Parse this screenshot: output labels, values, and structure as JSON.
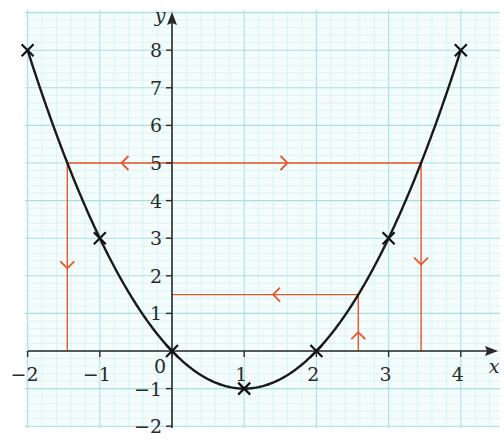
{
  "chart_data": {
    "type": "line",
    "title": "",
    "function": "y = x^2 - 2x",
    "xlabel": "x",
    "ylabel": "y",
    "xlim": [
      -2,
      4.4
    ],
    "ylim": [
      -2,
      8.6
    ],
    "x_ticks": [
      -2,
      -1,
      0,
      1,
      2,
      3,
      4
    ],
    "y_ticks": [
      -2,
      -1,
      1,
      2,
      3,
      4,
      5,
      6,
      7,
      8
    ],
    "x_tick_labels": [
      "−2",
      "−1",
      "0",
      "1",
      "2",
      "3",
      "4"
    ],
    "y_tick_labels": [
      "−2",
      "−1",
      "1",
      "2",
      "3",
      "4",
      "5",
      "6",
      "7",
      "8"
    ],
    "grid": true,
    "grid_minor_step": 0.2,
    "series": [
      {
        "name": "y = x² − 2x",
        "color": "#1a1a1a",
        "plotted_points": [
          {
            "x": -2,
            "y": 8
          },
          {
            "x": -1,
            "y": 3
          },
          {
            "x": 0,
            "y": 0
          },
          {
            "x": 1,
            "y": -1
          },
          {
            "x": 2,
            "y": 0
          },
          {
            "x": 3,
            "y": 3
          },
          {
            "x": 4,
            "y": 8
          }
        ]
      }
    ],
    "annotations": [
      {
        "type": "construction-line",
        "color": "#e8552b",
        "description": "y = 5 horizontal between curve intersections",
        "from": [
          -1.45,
          5
        ],
        "to": [
          3.45,
          5
        ],
        "arrows": [
          "left",
          "right"
        ]
      },
      {
        "type": "construction-line",
        "color": "#e8552b",
        "description": "vertical drop from (-1.45, 5) to x-axis",
        "from": [
          -1.45,
          5
        ],
        "to": [
          -1.45,
          0
        ],
        "arrows": [
          "down"
        ]
      },
      {
        "type": "construction-line",
        "color": "#e8552b",
        "description": "vertical drop from (3.45, 5) to x-axis",
        "from": [
          3.45,
          5
        ],
        "to": [
          3.45,
          0
        ],
        "arrows": [
          "down"
        ]
      },
      {
        "type": "construction-line",
        "color": "#e8552b",
        "description": "vertical up from x = 2.58 to curve",
        "from": [
          2.58,
          0
        ],
        "to": [
          2.58,
          1.5
        ],
        "arrows": [
          "up"
        ]
      },
      {
        "type": "construction-line",
        "color": "#e8552b",
        "description": "y = 1.5 horizontal from curve to y-axis",
        "from": [
          2.58,
          1.5
        ],
        "to": [
          0,
          1.5
        ],
        "arrows": [
          "left"
        ]
      }
    ],
    "colors": {
      "grid_minor": "#d4f0f0",
      "grid_major": "#a8e0e2",
      "curve": "#1a1a1a",
      "construction": "#e8552b"
    }
  }
}
